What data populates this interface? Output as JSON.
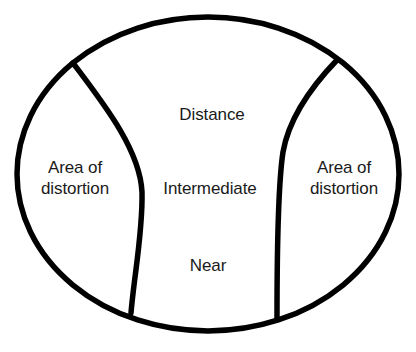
{
  "diagram": {
    "stroke_color": "#000000",
    "fill_color": "#ffffff",
    "text_color": "#1a1a1a",
    "stroke_width": 5.5,
    "lens_outline": {
      "shape": "ellipse",
      "center_x": 208,
      "center_y": 174,
      "radius_x": 191,
      "radius_y": 157
    },
    "zones": [
      {
        "id": "distance",
        "label": "Distance",
        "center_x": 212,
        "center_y": 114
      },
      {
        "id": "intermediate",
        "label": "Intermediate",
        "center_x": 210,
        "center_y": 188
      },
      {
        "id": "near",
        "label": "Near",
        "center_x": 208,
        "center_y": 265
      },
      {
        "id": "distortion-left",
        "label": "Area of\ndistortion",
        "center_x": 75,
        "center_y": 178
      },
      {
        "id": "distortion-right",
        "label": "Area of\ndistortion",
        "center_x": 344,
        "center_y": 178
      }
    ],
    "dividers": [
      {
        "id": "left-divider",
        "path": "M 73 63 C 104 104 140 150 142 192 C 143 232 134 276 131 313"
      },
      {
        "id": "right-divider",
        "path": "M 337 60 C 312 86 289 118 283 152 C 278 185 277 255 277 318"
      }
    ]
  }
}
